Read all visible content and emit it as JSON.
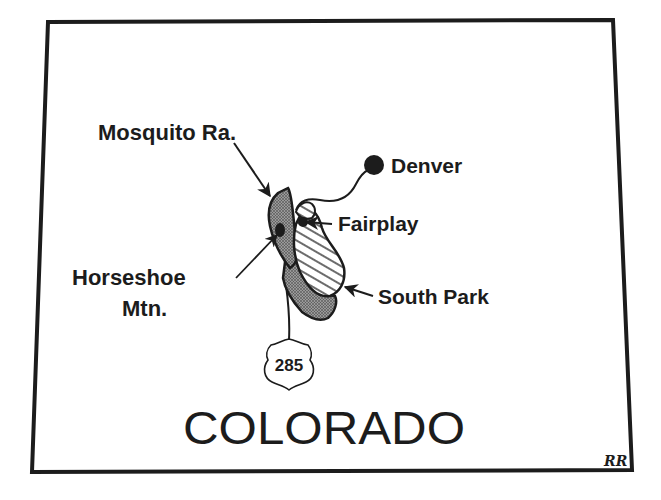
{
  "map": {
    "state_name": "COLORADO",
    "colors": {
      "ink": "#1c1c1c",
      "background": "#ffffff",
      "stipple_fill": "#8a8a8a"
    },
    "labels": {
      "mosquito_range": "Mosquito Ra.",
      "denver": "Denver",
      "fairplay": "Fairplay",
      "horseshoe_line1": "Horseshoe",
      "horseshoe_line2": "Mtn.",
      "south_park": "South Park"
    },
    "highway": {
      "route_number": "285",
      "icon": "us-highway-shield-icon"
    },
    "artist_initials": "RR",
    "features": [
      {
        "name": "Mosquito Range",
        "style": "stippled"
      },
      {
        "name": "Horseshoe Mountain",
        "style": "solid-dark"
      },
      {
        "name": "South Park",
        "style": "hatched"
      },
      {
        "name": "Fairplay",
        "style": "point"
      },
      {
        "name": "Denver",
        "style": "large-dot"
      }
    ]
  }
}
